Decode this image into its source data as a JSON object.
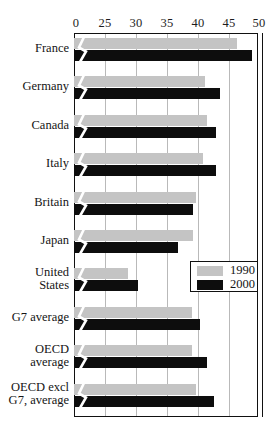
{
  "chart_data": {
    "type": "bar",
    "title": "",
    "subtitle": "",
    "xlabel": "",
    "ylabel": "",
    "orientation": "horizontal",
    "xlim": [
      0,
      50
    ],
    "axis_break": true,
    "axis_break_note": "x-axis broken between 0 and 25",
    "grid": true,
    "gridlines": [
      25,
      30,
      35,
      40,
      45
    ],
    "tick_labels": [
      "0",
      "25",
      "30",
      "35",
      "40",
      "45",
      "50"
    ],
    "tick_values": [
      0,
      25,
      30,
      35,
      40,
      45,
      50
    ],
    "legend_position": "middle-right",
    "categories": [
      "France",
      "Germany",
      "Canada",
      "Italy",
      "Britain",
      "Japan",
      "United States",
      "G7 average",
      "OECD average",
      "OECD excl G7, average"
    ],
    "series": [
      {
        "name": "1990",
        "color": "#c4c4c4",
        "values": [
          47.0,
          42.3,
          42.6,
          42.0,
          41.1,
          40.6,
          31.2,
          40.4,
          40.5,
          41.0
        ]
      },
      {
        "name": "2000",
        "color": "#0d0d0d",
        "values": [
          49.2,
          44.5,
          44.0,
          44.0,
          40.6,
          38.5,
          32.6,
          41.6,
          42.6,
          43.6
        ]
      }
    ]
  },
  "axis": {
    "ticks": [
      {
        "label": "0",
        "value": 0
      },
      {
        "label": "25",
        "value": 25
      },
      {
        "label": "30",
        "value": 30
      },
      {
        "label": "35",
        "value": 35
      },
      {
        "label": "40",
        "value": 40
      },
      {
        "label": "45",
        "value": 45
      },
      {
        "label": "50",
        "value": 50
      }
    ]
  },
  "categories": [
    {
      "label": "France"
    },
    {
      "label": "Germany"
    },
    {
      "label": "Canada"
    },
    {
      "label": "Italy"
    },
    {
      "label": "Britain"
    },
    {
      "label": "Japan"
    },
    {
      "label": "United\nStates",
      "lines": [
        "United",
        "States"
      ]
    },
    {
      "label": "G7 average"
    },
    {
      "label": "OECD\naverage",
      "lines": [
        "OECD",
        "average"
      ]
    },
    {
      "label": "OECD excl\nG7, average",
      "lines": [
        "OECD excl",
        "G7, average"
      ]
    }
  ],
  "legend": {
    "items": [
      {
        "label": "1990",
        "color": "#c4c4c4"
      },
      {
        "label": "2000",
        "color": "#0d0d0d"
      }
    ]
  },
  "colors": {
    "series_1990": "#c4c4c4",
    "series_2000": "#0d0d0d",
    "frame": "#111111",
    "grid": "#b9b9b9",
    "background": "#ffffff"
  }
}
